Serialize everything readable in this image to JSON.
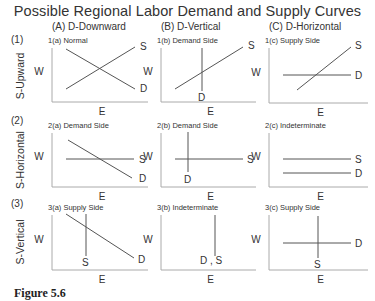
{
  "title": "Possible Regional Labor Demand and Supply Curves",
  "caption": "Figure 5.6",
  "columns": [
    {
      "label": "(A)   D-Downward",
      "x": 52
    },
    {
      "label": "(B)   D-Vertical",
      "x": 161
    },
    {
      "label": "(C)   D-Horizontal",
      "x": 269
    }
  ],
  "rows": [
    {
      "num": "(1)",
      "side_label": "S-Upward",
      "num_y": 43,
      "side_cy": 76
    },
    {
      "num": "(2)",
      "side_label": "S-Horizontal",
      "num_y": 124,
      "side_cy": 160
    },
    {
      "num": "(3)",
      "side_label": "S-Vertical",
      "num_y": 207,
      "side_cy": 242
    }
  ],
  "axis_labels": {
    "y": "W",
    "x": "E"
  },
  "panels": [
    {
      "id": "1a",
      "label": "1(a)  Normal",
      "ox": 52,
      "top": 48,
      "bottom": 102,
      "right": 148,
      "lines": [
        {
          "curve": "D",
          "x1": 66,
          "y1": 49,
          "x2": 135,
          "y2": 89,
          "lx": 140,
          "ly": 92
        },
        {
          "curve": "S",
          "x1": 66,
          "y1": 89,
          "x2": 135,
          "y2": 47,
          "lx": 140,
          "ly": 50
        }
      ]
    },
    {
      "id": "1b",
      "label": "1(b)  Demand Side",
      "ox": 161,
      "top": 48,
      "bottom": 102,
      "right": 256,
      "lines": [
        {
          "curve": "D",
          "x1": 202,
          "y1": 48,
          "x2": 202,
          "y2": 91,
          "lx": 198,
          "ly": 101
        },
        {
          "curve": "S",
          "x1": 175,
          "y1": 89,
          "x2": 243,
          "y2": 47,
          "lx": 248,
          "ly": 49
        }
      ]
    },
    {
      "id": "1c",
      "label": "1(c)  Supply Side",
      "ox": 269,
      "top": 48,
      "bottom": 103,
      "right": 368,
      "lines": [
        {
          "curve": "D",
          "x1": 283,
          "y1": 75,
          "x2": 351,
          "y2": 75,
          "lx": 355,
          "ly": 79
        },
        {
          "curve": "S",
          "x1": 297,
          "y1": 90,
          "x2": 351,
          "y2": 47,
          "lx": 355,
          "ly": 49
        }
      ]
    },
    {
      "id": "2a",
      "label": "2(a)  Demand Side",
      "ox": 52,
      "top": 133,
      "bottom": 187,
      "right": 148,
      "lines": [
        {
          "curve": "S",
          "x1": 66,
          "y1": 159,
          "x2": 134,
          "y2": 159,
          "lx": 139,
          "ly": 163
        },
        {
          "curve": "D",
          "x1": 68,
          "y1": 140,
          "x2": 132,
          "y2": 178,
          "lx": 139,
          "ly": 182
        }
      ]
    },
    {
      "id": "2b",
      "label": "2(b)  Demand Side",
      "ox": 161,
      "top": 133,
      "bottom": 187,
      "right": 256,
      "lines": [
        {
          "curve": "S",
          "x1": 175,
          "y1": 159,
          "x2": 243,
          "y2": 159,
          "lx": 247,
          "ly": 163
        },
        {
          "curve": "D",
          "x1": 188,
          "y1": 132,
          "x2": 188,
          "y2": 172,
          "lx": 184,
          "ly": 183
        }
      ]
    },
    {
      "id": "2c",
      "label": "2(c)  Indeterminate",
      "ox": 269,
      "top": 133,
      "bottom": 187,
      "right": 368,
      "lines": [
        {
          "curve": "S",
          "x1": 283,
          "y1": 159,
          "x2": 351,
          "y2": 159,
          "lx": 355,
          "ly": 163
        },
        {
          "curve": "D",
          "x1": 283,
          "y1": 173,
          "x2": 351,
          "y2": 173,
          "lx": 355,
          "ly": 177
        }
      ]
    },
    {
      "id": "3a",
      "label": "3(a)  Supply Side",
      "ox": 52,
      "top": 215,
      "bottom": 270,
      "right": 148,
      "lines": [
        {
          "curve": "D",
          "x1": 66,
          "y1": 214,
          "x2": 134,
          "y2": 258,
          "lx": 138,
          "ly": 263
        },
        {
          "curve": "S",
          "x1": 86,
          "y1": 214,
          "x2": 86,
          "y2": 256,
          "lx": 82,
          "ly": 266
        }
      ]
    },
    {
      "id": "3b",
      "label": "3(b)  Indeterminate",
      "ox": 161,
      "top": 215,
      "bottom": 270,
      "right": 256,
      "lines": [
        {
          "curve": "D , S",
          "x1": 215,
          "y1": 215,
          "x2": 215,
          "y2": 256,
          "lx": 200,
          "ly": 264
        }
      ]
    },
    {
      "id": "3c",
      "label": "3(c)  Supply Side",
      "ox": 269,
      "top": 215,
      "bottom": 270,
      "right": 368,
      "lines": [
        {
          "curve": "D",
          "x1": 283,
          "y1": 243,
          "x2": 351,
          "y2": 243,
          "lx": 355,
          "ly": 247
        },
        {
          "curve": "S",
          "x1": 318,
          "y1": 216,
          "x2": 318,
          "y2": 258,
          "lx": 314,
          "ly": 268
        }
      ]
    }
  ],
  "colors": {
    "axis": "#aaaaaa",
    "curve": "#555555",
    "text": "#333333"
  }
}
